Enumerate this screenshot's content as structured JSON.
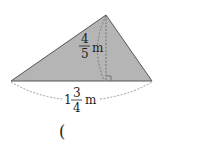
{
  "figure": {
    "shape": "triangle",
    "fill_color": "#b5b5b5",
    "stroke_color": "#555555",
    "height_label": {
      "whole": "",
      "numerator": "4",
      "denominator": "5",
      "unit": "m"
    },
    "base_label": {
      "whole": "1",
      "numerator": "3",
      "denominator": "4",
      "unit": "m"
    }
  },
  "answer": {
    "open_paren": "("
  }
}
